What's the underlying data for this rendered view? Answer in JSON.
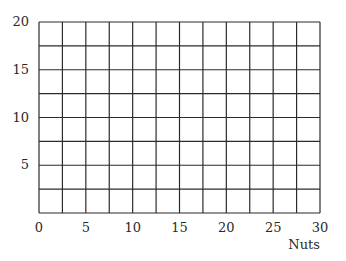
{
  "chart_data": {
    "type": "scatter",
    "title": "",
    "xlabel": "Nuts",
    "ylabel": "",
    "xlim": [
      0,
      30
    ],
    "ylim": [
      0,
      20
    ],
    "x_ticks": [
      0,
      5,
      10,
      15,
      20,
      25,
      30
    ],
    "y_ticks": [
      5,
      10,
      15,
      20
    ],
    "x_ticks_labels": [
      "0",
      "5",
      "10",
      "15",
      "20",
      "25",
      "30"
    ],
    "y_ticks_labels": [
      "5",
      "10",
      "15",
      "20"
    ],
    "grid": true,
    "grid_step_x": 2.5,
    "grid_step_y": 2.5,
    "series": [],
    "legend": null
  },
  "style": {
    "grid_color": "#2b2b2b",
    "background": "#ffffff"
  }
}
